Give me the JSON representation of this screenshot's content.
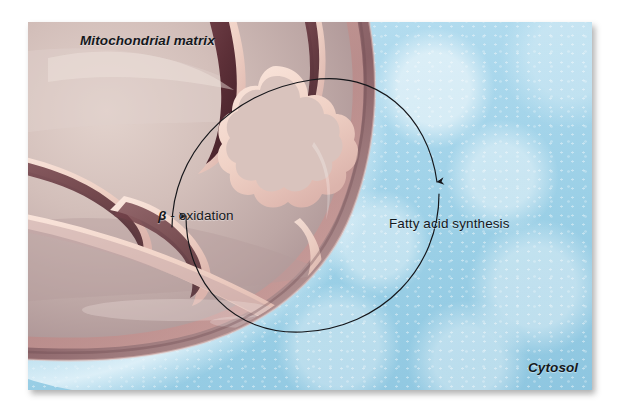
{
  "figure": {
    "kind": "biology-illustration",
    "labels": {
      "matrix": "Mitochondrial matrix",
      "beta_oxidation_greek": "β",
      "beta_oxidation_rest": " - oxidation",
      "fatty_acid_synthesis": "Fatty acid synthesis",
      "cytosol": "Cytosol"
    },
    "arrows": [
      {
        "name": "to-fatty-acid-synthesis",
        "direction": "clockwise",
        "from": "mitochondrial matrix",
        "to": "cytosol",
        "head": "down",
        "head_x": 437,
        "head_y": 191
      },
      {
        "name": "to-beta-oxidation",
        "direction": "clockwise",
        "from": "cytosol",
        "to": "mitochondrial matrix",
        "head": "up",
        "head_x": 186,
        "head_y": 206
      }
    ],
    "cycle": {
      "center_x": 311,
      "center_y": 208,
      "radius": 128,
      "stroke": "#15161a",
      "stroke_width": 1.1
    },
    "colors": {
      "cytosol": "#a9d7ec",
      "cytosol_highlight": "#d8eef8",
      "matrix": "#cdb9b5",
      "matrix_light": "#ddcdc8",
      "outer_membrane": "#8d6a6d",
      "inner_membrane_dark": "#6e4349",
      "crista_ridge": "#f3d9d0",
      "crista_shadow": "#5c3238",
      "rim_highlight": "#f0cfc6",
      "annotation_ink": "#14181c",
      "plate_border": "#ffffff"
    }
  }
}
